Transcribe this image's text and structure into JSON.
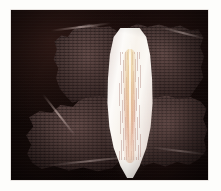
{
  "page": {
    "background_color": "#fdfdfb",
    "width": 221,
    "height": 191
  },
  "photo": {
    "name": "specimen-photograph",
    "kind": "scanned-photograph",
    "background_color": "#0a0403",
    "frame": {
      "left": 11,
      "top": 10,
      "width": 197,
      "height": 170
    },
    "description": "Dark-field photograph of a pale iridescent elongated pointed shell flanked by four ragged honeycomb-mesh fragments",
    "caption": ""
  },
  "subject": {
    "center_shell": {
      "name": "pearlescent-shell",
      "label": "",
      "color_pale": "#faf7f2",
      "color_core": "#e2b28c",
      "color_edge": "#9e807c"
    },
    "mesh_fragments": [
      {
        "name": "wing-upper-left",
        "label": "",
        "color": "#6e4a46"
      },
      {
        "name": "wing-upper-right",
        "label": "",
        "color": "#6e4a46"
      },
      {
        "name": "wing-lower-left",
        "label": "",
        "color": "#6e4a46"
      },
      {
        "name": "wing-lower-right",
        "label": "",
        "color": "#6e4a46"
      }
    ],
    "mesh_pattern": "honeycomb",
    "mesh_cell_color": "#120706"
  },
  "colors": {
    "plate_dark": "#0a0403",
    "mesh_mauve": "#6e4a46",
    "mesh_highlight": "#e4cdc8",
    "shell_white": "#fcfaf7",
    "page_white": "#fdfdfb"
  }
}
